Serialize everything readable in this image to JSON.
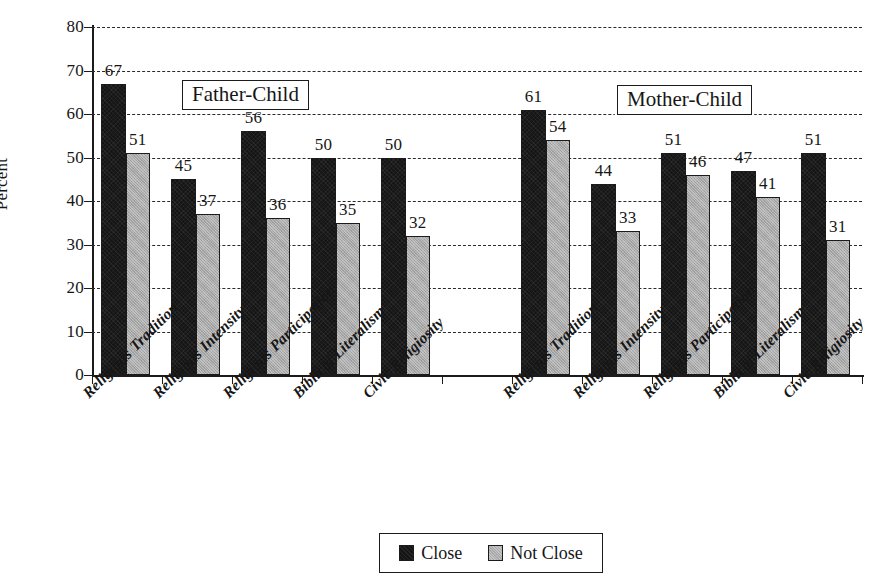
{
  "chart_data": {
    "type": "bar",
    "title": "",
    "xlabel": "",
    "ylabel": "Percent",
    "ylim": [
      0,
      80
    ],
    "ytick_step": 10,
    "yticks": [
      0,
      10,
      20,
      30,
      40,
      50,
      60,
      70,
      80
    ],
    "ytick_labels": [
      "0",
      "10",
      "20",
      "30",
      "40",
      "50",
      "60",
      "70",
      "80"
    ],
    "grid": "horizontal-dashed",
    "legend_position": "bottom-center",
    "panels": [
      {
        "name": "Father-Child",
        "categories": [
          "Religious Tradition",
          "Religious Intensity",
          "Religious Participation",
          "Biblical Literalism",
          "Civic Religiosity"
        ],
        "series": [
          {
            "name": "Close",
            "values": [
              67,
              45,
              56,
              50,
              50
            ]
          },
          {
            "name": "Not Close",
            "values": [
              51,
              37,
              36,
              35,
              32
            ]
          }
        ]
      },
      {
        "name": "Mother-Child",
        "categories": [
          "Religious Tradition",
          "Religious Intensity",
          "Religious Participation",
          "Biblical Literalism",
          "Civic Religiosity"
        ],
        "series": [
          {
            "name": "Close",
            "values": [
              61,
              44,
              51,
              47,
              51
            ]
          },
          {
            "name": "Not Close",
            "values": [
              54,
              33,
              46,
              41,
              31
            ]
          }
        ]
      }
    ],
    "legend": [
      {
        "label": "Close",
        "color": "#151515"
      },
      {
        "label": "Not Close",
        "color": "#a9a9a9"
      }
    ]
  },
  "axis": {
    "y_title": "Percent"
  },
  "panel_titles": {
    "father": "Father-Child",
    "mother": "Mother-Child"
  },
  "legend": {
    "close": "Close",
    "not_close": "Not Close"
  },
  "colors": {
    "close": "#151515",
    "not_close": "#a9a9a9",
    "axis": "#1b1b1b",
    "background": "#ffffff"
  }
}
